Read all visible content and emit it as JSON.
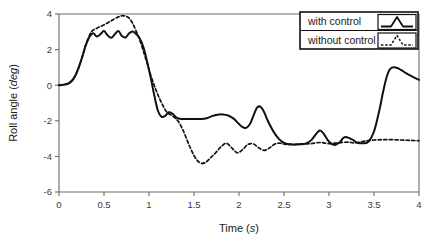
{
  "chart_data": {
    "type": "line",
    "title": "",
    "xlabel": "Time",
    "xlabel_unit": "s",
    "ylabel": "Roll angle",
    "ylabel_unit": "deg",
    "xlim": [
      0,
      4
    ],
    "ylim": [
      -6,
      4
    ],
    "xticks": [
      0,
      0.5,
      1,
      1.5,
      2,
      2.5,
      3,
      3.5,
      4
    ],
    "xticklabels": [
      "0",
      "0.5",
      "1",
      "1.5",
      "2",
      "2.5",
      "3",
      "3.5",
      "4"
    ],
    "yticks": [
      4,
      2,
      0,
      -2,
      -4,
      -6
    ],
    "yticklabels": [
      "4",
      "2",
      "0",
      "-2",
      "-4",
      "-6"
    ],
    "grid": false,
    "legend_position": "top-right",
    "legend_entries": [
      "with control",
      "without control"
    ],
    "series": [
      {
        "name": "with control",
        "style": "solid",
        "color": "#111111",
        "x": [
          0.0,
          0.05,
          0.1,
          0.14,
          0.18,
          0.22,
          0.26,
          0.3,
          0.34,
          0.38,
          0.42,
          0.46,
          0.5,
          0.54,
          0.58,
          0.62,
          0.66,
          0.7,
          0.74,
          0.78,
          0.82,
          0.86,
          0.9,
          0.94,
          0.98,
          1.02,
          1.06,
          1.1,
          1.14,
          1.18,
          1.22,
          1.26,
          1.3,
          1.34,
          1.4,
          1.46,
          1.52,
          1.58,
          1.64,
          1.7,
          1.76,
          1.82,
          1.88,
          1.94,
          2.0,
          2.04,
          2.08,
          2.12,
          2.16,
          2.2,
          2.24,
          2.28,
          2.32,
          2.38,
          2.44,
          2.5,
          2.56,
          2.62,
          2.68,
          2.74,
          2.8,
          2.86,
          2.9,
          2.94,
          3.0,
          3.06,
          3.12,
          3.16,
          3.2,
          3.26,
          3.32,
          3.38,
          3.44,
          3.5,
          3.56,
          3.6,
          3.64,
          3.68,
          3.74,
          3.8,
          3.86,
          3.92,
          4.0
        ],
        "y": [
          0.0,
          0.02,
          0.08,
          0.22,
          0.52,
          1.0,
          1.62,
          2.28,
          2.72,
          2.92,
          2.74,
          2.86,
          3.04,
          2.8,
          2.66,
          2.86,
          3.04,
          2.76,
          2.68,
          2.92,
          3.02,
          2.86,
          2.6,
          2.1,
          1.3,
          0.4,
          -0.6,
          -1.45,
          -1.78,
          -1.72,
          -1.52,
          -1.6,
          -1.8,
          -1.88,
          -1.9,
          -1.9,
          -1.9,
          -1.9,
          -1.86,
          -1.74,
          -1.66,
          -1.64,
          -1.7,
          -1.88,
          -2.18,
          -2.36,
          -2.4,
          -2.2,
          -1.72,
          -1.26,
          -1.22,
          -1.52,
          -2.0,
          -2.58,
          -3.0,
          -3.24,
          -3.32,
          -3.34,
          -3.32,
          -3.28,
          -3.1,
          -2.72,
          -2.54,
          -2.72,
          -3.18,
          -3.36,
          -3.2,
          -2.96,
          -2.92,
          -3.06,
          -3.24,
          -3.26,
          -3.16,
          -2.6,
          -1.4,
          -0.4,
          0.45,
          0.92,
          1.0,
          0.86,
          0.66,
          0.5,
          0.3
        ]
      },
      {
        "name": "without control",
        "style": "dashed",
        "color": "#111111",
        "x": [
          0.0,
          0.06,
          0.12,
          0.18,
          0.24,
          0.3,
          0.36,
          0.42,
          0.48,
          0.54,
          0.6,
          0.66,
          0.7,
          0.74,
          0.78,
          0.82,
          0.86,
          0.9,
          0.96,
          1.02,
          1.08,
          1.14,
          1.2,
          1.26,
          1.32,
          1.38,
          1.44,
          1.5,
          1.56,
          1.62,
          1.68,
          1.74,
          1.8,
          1.86,
          1.92,
          1.98,
          2.04,
          2.1,
          2.16,
          2.22,
          2.28,
          2.34,
          2.4,
          2.46,
          2.52,
          2.6,
          2.7,
          2.8,
          2.9,
          3.0,
          3.1,
          3.2,
          3.3,
          3.4,
          3.5,
          3.6,
          3.7,
          3.8,
          3.9,
          4.0
        ],
        "y": [
          0.0,
          0.04,
          0.16,
          0.55,
          1.3,
          2.3,
          3.0,
          3.2,
          3.34,
          3.5,
          3.68,
          3.84,
          3.9,
          3.88,
          3.76,
          3.46,
          3.0,
          2.5,
          1.55,
          0.55,
          -0.3,
          -1.0,
          -1.52,
          -1.72,
          -2.0,
          -2.55,
          -3.3,
          -3.95,
          -4.34,
          -4.36,
          -4.1,
          -3.8,
          -3.46,
          -3.26,
          -3.52,
          -3.8,
          -3.62,
          -3.32,
          -3.3,
          -3.52,
          -3.66,
          -3.52,
          -3.3,
          -3.26,
          -3.32,
          -3.32,
          -3.3,
          -3.28,
          -3.22,
          -3.28,
          -3.24,
          -3.2,
          -3.24,
          -3.14,
          -3.08,
          -3.06,
          -3.06,
          -3.08,
          -3.1,
          -3.12
        ]
      }
    ]
  },
  "legend": {
    "entries": [
      {
        "label": "with control",
        "style": "solid"
      },
      {
        "label": "without control",
        "style": "dashed"
      }
    ]
  }
}
